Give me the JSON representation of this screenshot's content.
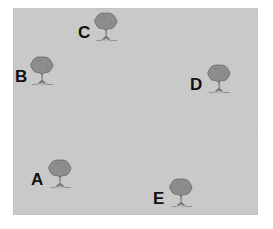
{
  "diagram": {
    "type": "spatial-layout",
    "background_color": "#ffffff",
    "field_color": "#c9c9c9",
    "label_color": "#111111",
    "tree_canopy_color": "#8d8d8d",
    "tree_trunk_color": "#7a7a7a",
    "watermark_text": "",
    "field": {
      "x": 13,
      "y": 8,
      "width": 245,
      "height": 207
    },
    "trees": [
      {
        "id": "tree-c",
        "label": "C",
        "icon": "tree-icon",
        "label_x": 78,
        "label_y": 24,
        "icon_x": 91,
        "icon_y": 11,
        "icon_w": 30,
        "icon_h": 32
      },
      {
        "id": "tree-b",
        "label": "B",
        "icon": "tree-icon",
        "label_x": 15,
        "label_y": 68,
        "icon_x": 27,
        "icon_y": 55,
        "icon_w": 30,
        "icon_h": 32
      },
      {
        "id": "tree-d",
        "label": "D",
        "icon": "tree-icon",
        "label_x": 190,
        "label_y": 76,
        "icon_x": 204,
        "icon_y": 63,
        "icon_w": 30,
        "icon_h": 32
      },
      {
        "id": "tree-a",
        "label": "A",
        "icon": "tree-icon",
        "label_x": 31,
        "label_y": 171,
        "icon_x": 45,
        "icon_y": 158,
        "icon_w": 30,
        "icon_h": 32
      },
      {
        "id": "tree-e",
        "label": "E",
        "icon": "tree-icon",
        "label_x": 153,
        "label_y": 190,
        "icon_x": 166,
        "icon_y": 177,
        "icon_w": 30,
        "icon_h": 32
      }
    ]
  }
}
